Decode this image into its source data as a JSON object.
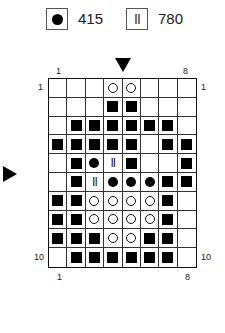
{
  "legend": [
    {
      "symbol": "filled-dot",
      "label": "415"
    },
    {
      "symbol": "double-bar",
      "glyph": "II",
      "label": "780"
    }
  ],
  "chart": {
    "columns": 8,
    "rows": 10,
    "top_labels": {
      "left": "1",
      "right": "8"
    },
    "bottom_labels": {
      "left": "1",
      "right": "8"
    },
    "row_labels": {
      "top_left": "1",
      "top_right": "1",
      "bottom_left": "10",
      "bottom_right": "10"
    },
    "markers": {
      "center_column": "down-arrow between columns 4 and 5",
      "center_row": "right-arrow at row 6"
    },
    "symbols_key": {
      ".": "empty",
      "S": "filled-square",
      "O": "open-circle",
      "D": "filled-dot",
      "I": "double-bar (II)"
    },
    "grid": [
      [
        ".",
        ".",
        ".",
        "O",
        "O",
        ".",
        ".",
        "."
      ],
      [
        ".",
        ".",
        ".",
        "S",
        "S",
        ".",
        ".",
        "."
      ],
      [
        ".",
        "S",
        "S",
        "S",
        "S",
        "S",
        "S",
        "."
      ],
      [
        "S",
        "S",
        "S",
        "S",
        "S",
        ".",
        "S",
        "S"
      ],
      [
        ".",
        "S",
        "D",
        "I",
        "S",
        ".",
        ".",
        "S"
      ],
      [
        ".",
        "S",
        "I",
        "D",
        "D",
        "D",
        "S",
        "S"
      ],
      [
        "S",
        "S",
        "O",
        "O",
        "O",
        "O",
        "S",
        "."
      ],
      [
        "S",
        "S",
        "O",
        "O",
        "O",
        "O",
        "S",
        "."
      ],
      [
        "S",
        "S",
        "S",
        "O",
        "O",
        "S",
        "S",
        "."
      ],
      [
        ".",
        "S",
        "S",
        "S",
        "S",
        "S",
        "S",
        "."
      ]
    ]
  }
}
